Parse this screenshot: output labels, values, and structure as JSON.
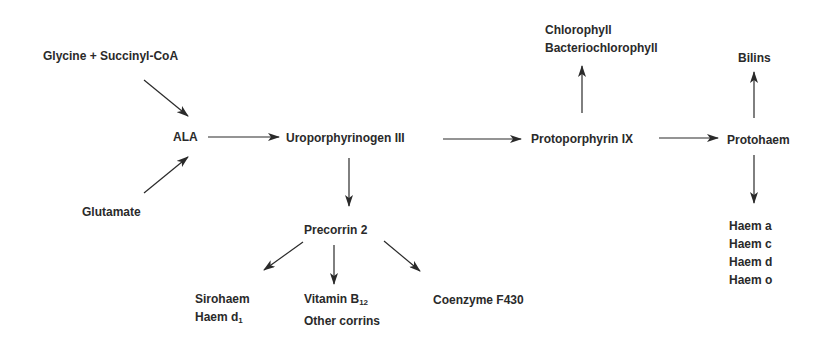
{
  "diagram": {
    "colors": {
      "text": "#2a2a2a",
      "arrow": "#2a2a2a",
      "background": "#ffffff"
    },
    "nodes": {
      "glycine_succinyl": {
        "label": "Glycine + Succinyl-CoA"
      },
      "glutamate": {
        "label": "Glutamate"
      },
      "ala": {
        "label": "ALA"
      },
      "uroporphyrinogen": {
        "label": "Uroporphyrinogen III"
      },
      "protoporphyrin": {
        "label": "Protoporphyrin IX"
      },
      "chlorophyll": {
        "lines": [
          "Chlorophyll",
          "Bacteriochlorophyll"
        ]
      },
      "protohaem": {
        "label": "Protohaem"
      },
      "bilins": {
        "label": "Bilins"
      },
      "haems": {
        "lines": [
          "Haem a",
          "Haem c",
          "Haem d",
          "Haem o"
        ]
      },
      "precorrin": {
        "label": "Precorrin 2"
      },
      "sirohaem": {
        "line1": "Sirohaem",
        "line2_main": "Haem d",
        "line2_sub": "1"
      },
      "vitamin": {
        "line1_main": "Vitamin B",
        "line1_sub": "12",
        "line2": "Other corrins"
      },
      "coenzyme": {
        "label": "Coenzyme F430"
      }
    },
    "edges": [
      {
        "from": "Glycine + Succinyl-CoA",
        "to": "ALA"
      },
      {
        "from": "Glutamate",
        "to": "ALA"
      },
      {
        "from": "ALA",
        "to": "Uroporphyrinogen III"
      },
      {
        "from": "Uroporphyrinogen III",
        "to": "Protoporphyrin IX"
      },
      {
        "from": "Uroporphyrinogen III",
        "to": "Precorrin 2"
      },
      {
        "from": "Protoporphyrin IX",
        "to": "Chlorophyll / Bacteriochlorophyll"
      },
      {
        "from": "Protoporphyrin IX",
        "to": "Protohaem"
      },
      {
        "from": "Protohaem",
        "to": "Bilins"
      },
      {
        "from": "Protohaem",
        "to": "Haem a / c / d / o"
      },
      {
        "from": "Precorrin 2",
        "to": "Sirohaem / Haem d1"
      },
      {
        "from": "Precorrin 2",
        "to": "Vitamin B12 / Other corrins"
      },
      {
        "from": "Precorrin 2",
        "to": "Coenzyme F430"
      }
    ]
  }
}
